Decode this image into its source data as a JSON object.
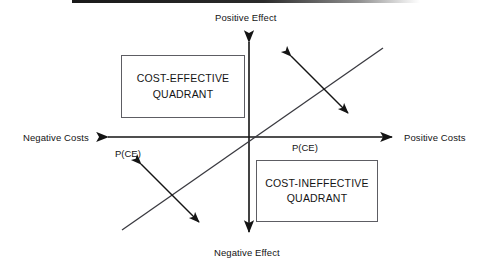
{
  "diagram": {
    "title_visible": false,
    "axes": {
      "vertical_top_label": "Positive Effect",
      "vertical_bottom_label": "Negative Effect",
      "horizontal_left_label": "Negative Costs",
      "horizontal_right_label": "Positive Costs",
      "line_color": "#141414",
      "origin": {
        "x": 249,
        "y": 137
      }
    },
    "quadrant_boxes": [
      {
        "id": "cost-effective",
        "line1": "COST-EFFECTIVE",
        "line2": "QUADRANT",
        "border_color": "#5d5d63",
        "fill_color": "#ffffff"
      },
      {
        "id": "cost-ineffective",
        "line1": "COST-INEFFECTIVE",
        "line2": "QUADRANT",
        "border_color": "#5d5d63",
        "fill_color": "#ffffff"
      }
    ],
    "diagonal": {
      "description": "45-degree line through origin",
      "color": "#3a3a40",
      "start": {
        "x": 122,
        "y": 230
      },
      "end": {
        "x": 383,
        "y": 48
      }
    },
    "uncertainty_arrows": [
      {
        "id": "upper-right",
        "label": "P(CE)"
      },
      {
        "id": "lower-left",
        "label": "P(CE)"
      }
    ],
    "scan_artifact": {
      "present": true,
      "color": "#1a1a1a"
    }
  }
}
